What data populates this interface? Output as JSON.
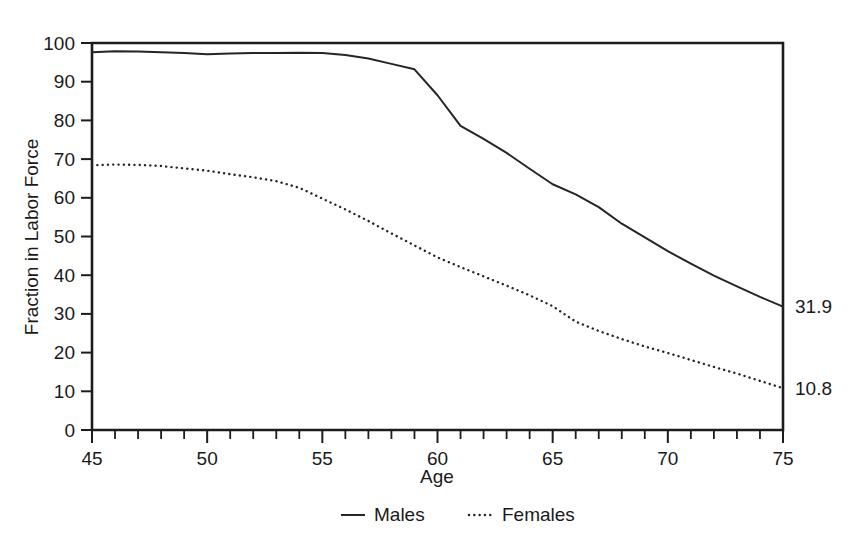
{
  "chart_data": {
    "type": "line",
    "title": "",
    "xlabel": "Age",
    "ylabel": "Fraction in Labor Force",
    "xlim": [
      45,
      75
    ],
    "ylim": [
      0,
      100
    ],
    "grid": false,
    "legend_position": "bottom-center",
    "x_ticks_major": [
      45,
      50,
      55,
      60,
      65,
      70,
      75
    ],
    "x_ticks_minor_step": 1,
    "y_ticks_major": [
      0,
      10,
      20,
      30,
      40,
      50,
      60,
      70,
      80,
      90,
      100
    ],
    "x": [
      45,
      46,
      47,
      48,
      49,
      50,
      51,
      52,
      53,
      54,
      55,
      56,
      57,
      58,
      59,
      60,
      61,
      62,
      63,
      64,
      65,
      66,
      67,
      68,
      69,
      70,
      71,
      72,
      73,
      74,
      75
    ],
    "series": [
      {
        "name": "Males",
        "style": "solid",
        "end_label": "31.9",
        "values": [
          97.6,
          97.9,
          97.8,
          97.6,
          97.4,
          97.1,
          97.3,
          97.4,
          97.4,
          97.5,
          97.4,
          96.9,
          96.0,
          94.6,
          93.2,
          86.5,
          78.6,
          75.2,
          71.6,
          67.5,
          63.5,
          60.9,
          57.6,
          53.3,
          49.8,
          46.2,
          43.0,
          39.9,
          37.1,
          34.4,
          31.9
        ]
      },
      {
        "name": "Females",
        "style": "dotted",
        "end_label": "10.8",
        "values": [
          68.4,
          68.6,
          68.5,
          68.2,
          67.6,
          67.0,
          66.1,
          65.3,
          64.3,
          62.6,
          59.8,
          57.0,
          54.0,
          50.8,
          47.7,
          44.6,
          42.1,
          39.7,
          37.3,
          34.8,
          32.0,
          28.0,
          25.6,
          23.5,
          21.6,
          19.9,
          18.1,
          16.3,
          14.6,
          12.7,
          10.8
        ]
      }
    ],
    "legend": [
      {
        "label": "Males",
        "style": "solid"
      },
      {
        "label": "Females",
        "style": "dotted"
      }
    ],
    "end_annotations": [
      {
        "value": "31.9",
        "series": "Males"
      },
      {
        "value": "10.8",
        "series": "Females"
      }
    ]
  }
}
